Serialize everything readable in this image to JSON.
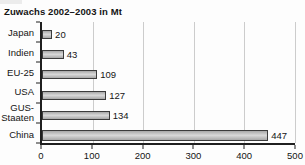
{
  "title": "Zuwachs 2002–2003 in Mt",
  "chart_data": {
    "type": "bar",
    "orientation": "horizontal",
    "title": "Zuwachs 2002–2003 in Mt",
    "categories": [
      "Japan",
      "Indien",
      "EU-25",
      "USA",
      "GUS-Staaten",
      "China"
    ],
    "values": [
      20,
      43,
      109,
      127,
      134,
      447
    ],
    "value_labels_shown": true,
    "xlabel": "",
    "ylabel": "",
    "xlim": [
      0,
      500
    ],
    "x_ticks": [
      0,
      100,
      200,
      300,
      400,
      500
    ],
    "grid": "vertical-gridlines",
    "legend": "none"
  },
  "colors": {
    "background": "#fdfdfd",
    "bar_fill": "#a8a8a8",
    "bar_fill_highlight": "#d9d9d9",
    "bar_border": "#3c3c3c",
    "axis": "#1f1f1f",
    "gridline": "#cccccc",
    "text": "#141414",
    "corner_artifact": "#ececec"
  }
}
